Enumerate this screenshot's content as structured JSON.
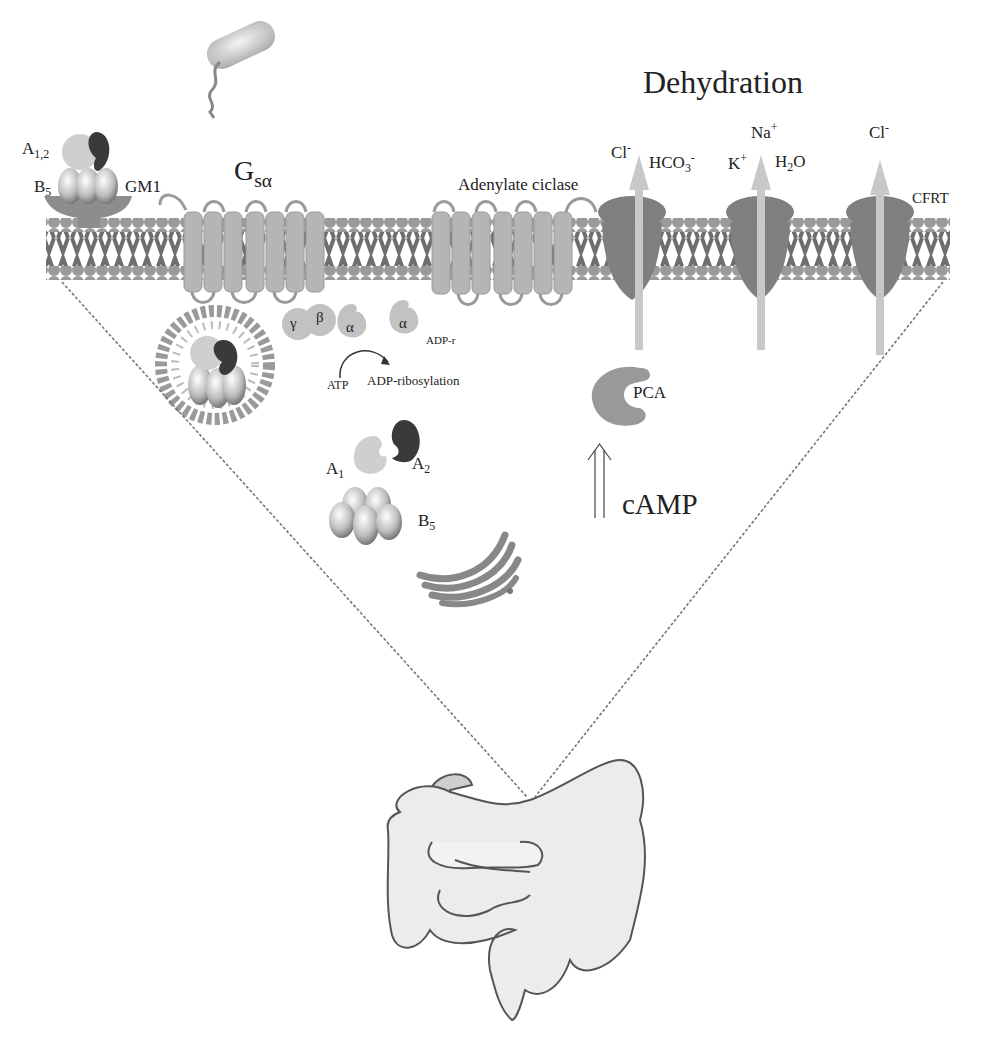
{
  "diagram": {
    "title": "Dehydration",
    "colors": {
      "membrane_head": "#9a9a9a",
      "membrane_tail": "#6e6e6e",
      "receptor": "#b5b5b5",
      "channel": "#7a7a7a",
      "arrow": "#c8c8c8",
      "intestine_fill": "#ececec",
      "intestine_stroke": "#555555",
      "toxin_light": "#cfcfcf",
      "toxin_dark": "#3a3a3a"
    },
    "labels": {
      "toxin_a": {
        "base": "A",
        "sub": "1,2"
      },
      "toxin_b": {
        "base": "B",
        "sub": "5"
      },
      "gm1": "GM1",
      "gs_alpha": {
        "base": "G",
        "sub": "sα"
      },
      "adenylate": "Adenylate ciclase",
      "gamma": "γ",
      "beta": "β",
      "alpha1": "α",
      "alpha2": "α",
      "adp_r": "ADP-r",
      "atp": "ATP",
      "adp_ribosylation": "ADP-ribosylation",
      "a1": {
        "base": "A",
        "sub": "1"
      },
      "a2": {
        "base": "A",
        "sub": "2"
      },
      "b5": {
        "base": "B",
        "sub": "5"
      },
      "pca": "PCA",
      "camp": "cAMP",
      "cl1": {
        "base": "Cl",
        "sup": "-"
      },
      "hco3": {
        "base": "HCO",
        "sub": "3",
        "sup": "-"
      },
      "na": {
        "base": "Na",
        "sup": "+"
      },
      "k": {
        "base": "K",
        "sup": "+"
      },
      "h2o": {
        "base": "H",
        "sub": "2",
        "rest": "O"
      },
      "cl2": {
        "base": "Cl",
        "sup": "-"
      },
      "cfrt": "CFRT"
    }
  }
}
